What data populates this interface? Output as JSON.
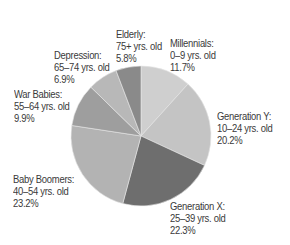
{
  "chart_data": {
    "type": "pie",
    "title": "",
    "start_angle": "12 o'clock",
    "direction": "clockwise",
    "slices": [
      {
        "name": "Millennials",
        "range": "0–9 yrs. old",
        "value": 11.7,
        "color": "#cfcfcf",
        "label_pos": [
          170,
          37
        ]
      },
      {
        "name": "Generation Y",
        "range": "10–24 yrs. old",
        "value": 20.2,
        "color": "#c4c4c4",
        "label_pos": [
          217,
          110
        ]
      },
      {
        "name": "Generation X",
        "range": "25–39 yrs. old",
        "value": 22.3,
        "color": "#6e6e6e",
        "label_pos": [
          170,
          200
        ]
      },
      {
        "name": "Baby Boomers",
        "range": "40–54 yrs. old",
        "value": 23.2,
        "color": "#b3b3b3",
        "label_pos": [
          13,
          173
        ]
      },
      {
        "name": "War Babies",
        "range": "55–64 yrs. old",
        "value": 9.9,
        "color": "#9e9e9e",
        "label_pos": [
          14,
          88
        ]
      },
      {
        "name": "Depression",
        "range": "65–74 yrs. old",
        "value": 6.9,
        "color": "#b8b8b8",
        "label_pos": [
          54,
          49
        ]
      },
      {
        "name": "Elderly",
        "range": "75+ yrs. old",
        "value": 5.8,
        "color": "#8a8a8a",
        "label_pos": [
          116,
          28
        ]
      }
    ],
    "center": [
      141,
      136
    ],
    "radius": 70
  },
  "labels": [
    {
      "title": "Millennials:",
      "range": "0–9 yrs. old",
      "pct": "11.7%"
    },
    {
      "title": "Generation Y:",
      "range": "10–24 yrs. old",
      "pct": "20.2%"
    },
    {
      "title": "Generation X:",
      "range": "25–39 yrs. old",
      "pct": "22.3%"
    },
    {
      "title": "Baby Boomers:",
      "range": "40–54 yrs. old",
      "pct": "23.2%"
    },
    {
      "title": "War Babies:",
      "range": "55–64 yrs. old",
      "pct": "9.9%"
    },
    {
      "title": "Depression:",
      "range": "65–74 yrs. old",
      "pct": "6.9%"
    },
    {
      "title": "Elderly:",
      "range": "75+ yrs. old",
      "pct": "5.8%"
    }
  ]
}
